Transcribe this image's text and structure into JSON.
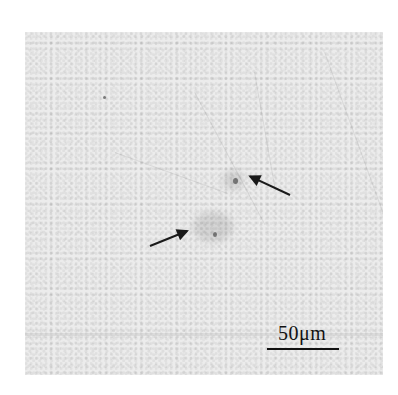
{
  "figure": {
    "type": "micrograph",
    "arrows": [
      {
        "name": "upper-right-arrow",
        "points_to": "dark spot near center-right"
      },
      {
        "name": "lower-left-arrow",
        "points_to": "dark spot near center"
      }
    ],
    "scale_bar": {
      "label": "50μm"
    }
  }
}
